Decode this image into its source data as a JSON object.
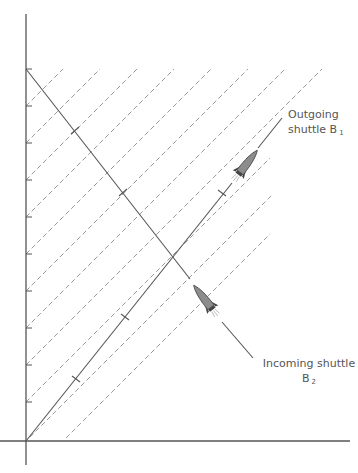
{
  "diagram": {
    "type": "spacetime-diagram",
    "colors": {
      "axis": "#555555",
      "worldline": "#555555",
      "dashed": "#9a9a9a",
      "rocket_body": "#8c8c8c",
      "rocket_dark": "#444444",
      "text": "#555555"
    },
    "axes": {
      "origin": [
        26,
        441
      ],
      "vertical_ticks_y": [
        69,
        106,
        143,
        180,
        217,
        254,
        291,
        328,
        365,
        402
      ]
    },
    "signal_lines_intercepts": [
      106,
      143,
      180,
      217,
      254,
      291,
      328,
      365,
      402,
      441,
      478
    ],
    "labels": {
      "outgoing": {
        "line1": "Outgoing",
        "line2": "shuttle B",
        "subscript": "1"
      },
      "incoming": {
        "line1": "Incoming shuttle",
        "line2": "B",
        "subscript": "2"
      }
    }
  }
}
